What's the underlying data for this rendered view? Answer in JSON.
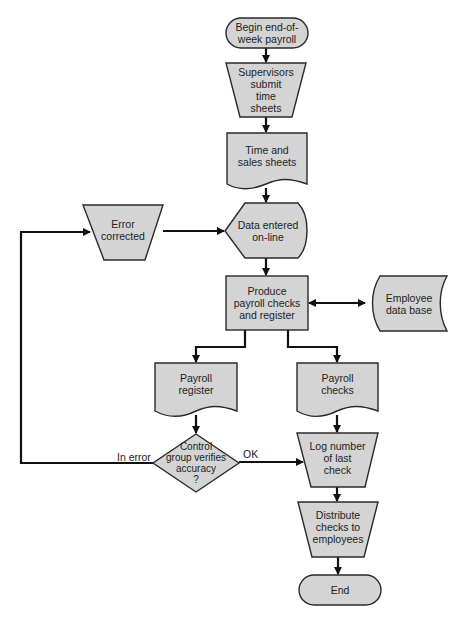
{
  "diagram": {
    "type": "flowchart",
    "colors": {
      "fill": "#d4d4d4",
      "stroke": "#2a2a2a",
      "line": "#111111",
      "background": "#ffffff"
    },
    "nodes": [
      {
        "id": "begin",
        "shape": "terminal",
        "label": "Begin end-of-\nweek payroll"
      },
      {
        "id": "supervisors",
        "shape": "manual-operation",
        "label": "Supervisors\nsubmit\ntime\nsheets"
      },
      {
        "id": "time_sheets",
        "shape": "document",
        "label": "Time and\nsales sheets"
      },
      {
        "id": "data_entered",
        "shape": "display",
        "label": "Data entered\non-line"
      },
      {
        "id": "error_corrected",
        "shape": "manual-operation",
        "label": "Error\ncorrected"
      },
      {
        "id": "produce",
        "shape": "process",
        "label": "Produce\npayroll checks\nand register"
      },
      {
        "id": "employee_db",
        "shape": "stored-data",
        "label": "Employee\ndata base"
      },
      {
        "id": "payroll_register",
        "shape": "document",
        "label": "Payroll\nregister"
      },
      {
        "id": "payroll_checks",
        "shape": "document",
        "label": "Payroll\nchecks"
      },
      {
        "id": "control_group",
        "shape": "decision",
        "label": "Control\ngroup verifies\naccuracy\n?"
      },
      {
        "id": "log_number",
        "shape": "manual-operation",
        "label": "Log number\nof last\ncheck"
      },
      {
        "id": "distribute",
        "shape": "manual-operation",
        "label": "Distribute\nchecks to\nemployees"
      },
      {
        "id": "end",
        "shape": "terminal",
        "label": "End"
      }
    ],
    "edges": [
      {
        "from": "begin",
        "to": "supervisors"
      },
      {
        "from": "supervisors",
        "to": "time_sheets"
      },
      {
        "from": "time_sheets",
        "to": "data_entered"
      },
      {
        "from": "error_corrected",
        "to": "data_entered"
      },
      {
        "from": "data_entered",
        "to": "produce"
      },
      {
        "from": "produce",
        "to": "employee_db",
        "bidirectional": true
      },
      {
        "from": "produce",
        "to": "payroll_register"
      },
      {
        "from": "produce",
        "to": "payroll_checks"
      },
      {
        "from": "payroll_register",
        "to": "control_group"
      },
      {
        "from": "payroll_checks",
        "to": "log_number"
      },
      {
        "from": "control_group",
        "to": "log_number",
        "label": "OK"
      },
      {
        "from": "control_group",
        "to": "error_corrected",
        "label": "In error"
      },
      {
        "from": "log_number",
        "to": "distribute"
      },
      {
        "from": "distribute",
        "to": "end"
      }
    ]
  },
  "labels": {
    "begin": "Begin end-of-\nweek payroll",
    "supervisors": "Supervisors\nsubmit\ntime\nsheets",
    "time_sheets": "Time and\nsales sheets",
    "data_entered": "Data entered\non-line",
    "error_corrected": "Error\ncorrected",
    "produce": "Produce\npayroll checks\nand register",
    "employee_db": "Employee\ndata base",
    "payroll_register": "Payroll\nregister",
    "payroll_checks": "Payroll\nchecks",
    "control_group": "Control\ngroup verifies\naccuracy\n?",
    "log_number": "Log number\nof last\ncheck",
    "distribute": "Distribute\nchecks to\nemployees",
    "end": "End",
    "edge_ok": "OK",
    "edge_in_error": "In error"
  }
}
